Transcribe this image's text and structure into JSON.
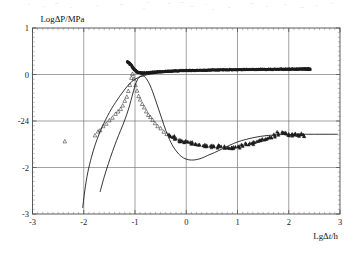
{
  "figure": {
    "background_color": "#ffffff",
    "frame_color": "#4a4a4a",
    "grid_color": "#7a7a7a",
    "data_color": "#1d1d1d"
  },
  "axes": {
    "y_title": "LogΔP/MPa",
    "x_title_prefix": "Lg",
    "x_title_delta": "Δ",
    "x_title_var": "t",
    "x_title_suffix": "/h",
    "y_tick_labels": [
      "1",
      "0",
      "-24",
      "-2",
      "-3"
    ],
    "x_tick_labels": [
      "-3",
      "-2",
      "-1",
      "0",
      "1",
      "2",
      "3"
    ]
  },
  "chart_data": {
    "type": "scatter",
    "title": "",
    "subtitle": "",
    "xlabel": "LgΔt/h",
    "ylabel": "LogΔP/MPa",
    "xlim": [
      -3,
      3
    ],
    "ylim": [
      -3,
      1
    ],
    "x_ticks": [
      -3,
      -2,
      -1,
      0,
      1,
      2,
      3
    ],
    "y_ticks": [
      1,
      0,
      -1,
      -2,
      -3
    ],
    "y_tick_display": [
      "1",
      "0",
      "-24",
      "-2",
      "-3"
    ],
    "grid": true,
    "legend": "none",
    "x_minor_ticks_per_interval": 9,
    "y_minor_ticks_per_interval": 9,
    "series": [
      {
        "name": "pressure-data",
        "style": "filled-band",
        "marker": "triangle",
        "note": "Upper dark plateau band of measured pressure points",
        "x": [
          -1.15,
          -1.08,
          -1.02,
          -0.95,
          -0.85,
          -0.72,
          -0.58,
          -0.42,
          -0.25,
          -0.05,
          0.15,
          0.38,
          0.6,
          0.82,
          1.05,
          1.28,
          1.5,
          1.72,
          1.95,
          2.12,
          2.26,
          2.36,
          2.42
        ],
        "y": [
          0.28,
          0.22,
          0.12,
          0.05,
          0.03,
          0.04,
          0.055,
          0.065,
          0.075,
          0.085,
          0.09,
          0.095,
          0.1,
          0.103,
          0.106,
          0.109,
          0.112,
          0.114,
          0.116,
          0.118,
          0.12,
          0.12,
          0.12
        ]
      },
      {
        "name": "pressure-derivative-data",
        "style": "open-triangles",
        "marker": "triangle",
        "note": "Lower scattered derivative points with hump, trough and late rise",
        "x": [
          -2.37,
          -1.78,
          -1.72,
          -1.68,
          -1.62,
          -1.56,
          -1.5,
          -1.44,
          -1.38,
          -1.33,
          -1.28,
          -1.24,
          -1.2,
          -1.16,
          -1.13,
          -1.1,
          -1.07,
          -1.05,
          -1.02,
          -0.99,
          -0.96,
          -0.93,
          -0.9,
          -0.86,
          -0.82,
          -0.78,
          -0.74,
          -0.7,
          -0.66,
          -0.61,
          -0.56,
          -0.5,
          -0.44,
          -0.38,
          -0.32,
          -0.26,
          -0.2,
          -0.14,
          -0.08,
          -0.02,
          0.05,
          0.12,
          0.19,
          0.26,
          0.33,
          0.4,
          0.47,
          0.54,
          0.61,
          0.68,
          0.75,
          0.82,
          0.89,
          0.96,
          1.03,
          1.1,
          1.17,
          1.24,
          1.31,
          1.38,
          1.45,
          1.52,
          1.59,
          1.66,
          1.73,
          1.8,
          1.87,
          1.94,
          2.0,
          2.06,
          2.12,
          2.18,
          2.24,
          2.3
        ],
        "y": [
          -1.45,
          -1.32,
          -1.24,
          -1.19,
          -1.12,
          -1.05,
          -0.98,
          -0.92,
          -0.86,
          -0.8,
          -0.74,
          -0.66,
          -0.58,
          -0.48,
          -0.36,
          -0.22,
          -0.08,
          0.02,
          -0.1,
          -0.24,
          -0.36,
          -0.46,
          -0.55,
          -0.64,
          -0.72,
          -0.79,
          -0.86,
          -0.92,
          -0.98,
          -1.04,
          -1.1,
          -1.16,
          -1.22,
          -1.27,
          -1.31,
          -1.35,
          -1.38,
          -1.41,
          -1.43,
          -1.45,
          -1.47,
          -1.48,
          -1.5,
          -1.51,
          -1.52,
          -1.53,
          -1.54,
          -1.55,
          -1.55,
          -1.56,
          -1.56,
          -1.57,
          -1.57,
          -1.56,
          -1.55,
          -1.53,
          -1.51,
          -1.49,
          -1.47,
          -1.45,
          -1.43,
          -1.41,
          -1.38,
          -1.35,
          -1.31,
          -1.27,
          -1.24,
          -1.26,
          -1.29,
          -1.3,
          -1.3,
          -1.29,
          -1.3,
          -1.33
        ]
      },
      {
        "name": "pressure-model-curve",
        "style": "line",
        "note": "Steeply rising model match through pressure data into plateau",
        "x": [
          -2.02,
          -1.98,
          -1.92,
          -1.85,
          -1.78,
          -1.7,
          -1.62,
          -1.54,
          -1.46,
          -1.38,
          -1.3,
          -1.22,
          -1.14,
          -1.06,
          -0.98,
          -0.88,
          -0.76,
          -0.62,
          -0.46,
          -0.28,
          -0.08,
          0.15,
          0.4,
          0.7,
          1.0,
          1.35,
          1.7,
          2.05,
          2.4
        ],
        "y": [
          -2.86,
          -2.5,
          -2.1,
          -1.78,
          -1.52,
          -1.28,
          -1.08,
          -0.9,
          -0.74,
          -0.6,
          -0.47,
          -0.35,
          -0.24,
          -0.15,
          -0.09,
          -0.04,
          -0.005,
          0.02,
          0.04,
          0.055,
          0.068,
          0.08,
          0.09,
          0.098,
          0.104,
          0.11,
          0.114,
          0.117,
          0.12
        ]
      },
      {
        "name": "derivative-model-curve",
        "style": "line",
        "note": "Derivative model: rises to hump near x=-1, falls to trough, rises late",
        "x": [
          -1.68,
          -1.6,
          -1.52,
          -1.44,
          -1.36,
          -1.28,
          -1.2,
          -1.12,
          -1.04,
          -0.98,
          -0.92,
          -0.86,
          -0.8,
          -0.72,
          -0.64,
          -0.56,
          -0.48,
          -0.4,
          -0.3,
          -0.2,
          -0.1,
          0.0,
          0.1,
          0.2,
          0.3,
          0.42,
          0.55,
          0.7,
          0.85,
          1.0,
          1.15,
          1.3,
          1.45,
          1.6,
          1.75,
          1.9,
          2.05,
          2.2,
          2.35,
          2.5,
          2.65,
          2.8,
          2.95
        ],
        "y": [
          -2.52,
          -2.2,
          -1.92,
          -1.66,
          -1.42,
          -1.2,
          -0.98,
          -0.72,
          -0.4,
          -0.18,
          -0.06,
          -0.03,
          -0.06,
          -0.2,
          -0.42,
          -0.68,
          -0.94,
          -1.2,
          -1.46,
          -1.64,
          -1.76,
          -1.82,
          -1.84,
          -1.83,
          -1.8,
          -1.74,
          -1.68,
          -1.6,
          -1.52,
          -1.45,
          -1.4,
          -1.36,
          -1.33,
          -1.31,
          -1.3,
          -1.29,
          -1.29,
          -1.285,
          -1.285,
          -1.285,
          -1.285,
          -1.285,
          -1.285
        ]
      }
    ]
  }
}
